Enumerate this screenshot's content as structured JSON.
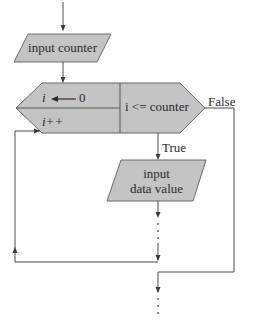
{
  "colors": {
    "shape_fill": "#c4c4c4",
    "line": "#4a4a4a",
    "text": "#2a2a2a",
    "background": "#ffffff"
  },
  "flowchart": {
    "input_counter": {
      "label": "input counter"
    },
    "for_loop": {
      "init_var": "i",
      "init_value": "0",
      "init_arrow": "left-arrow",
      "increment": "i++",
      "condition": "i <= counter"
    },
    "branch_false_label": "False",
    "branch_true_label": "True",
    "input_data_value": {
      "line1": "input",
      "line2": "data value"
    }
  }
}
